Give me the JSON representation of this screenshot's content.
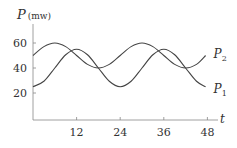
{
  "chart_data": {
    "type": "line",
    "title": "",
    "ylabel_var": "P",
    "ylabel_unit": "(mw)",
    "xlabel": "t",
    "x_ticks": [
      12,
      24,
      36,
      48
    ],
    "y_ticks": [
      20,
      40,
      60
    ],
    "xlim": [
      0,
      48
    ],
    "ylim": [
      0,
      75
    ],
    "grid": false,
    "legend_position": "inline-right",
    "x": [
      0,
      3,
      6,
      9,
      12,
      15,
      18,
      21,
      24,
      27,
      30,
      33,
      36,
      39,
      42,
      45,
      48
    ],
    "series": [
      {
        "name": "P1",
        "label_main": "P",
        "label_sub": "1",
        "formula": "40 - 15*cos(2*pi*t/24)",
        "values": [
          25,
          29.4,
          40,
          50.6,
          55,
          50.6,
          40,
          29.4,
          25,
          29.4,
          40,
          50.6,
          55,
          50.6,
          40,
          29.4,
          25
        ]
      },
      {
        "name": "P2",
        "label_main": "P",
        "label_sub": "2",
        "formula": "50 + 10*sin(2*pi*t/24)",
        "values": [
          50,
          57.1,
          60,
          57.1,
          50,
          42.9,
          40,
          42.9,
          50,
          57.1,
          60,
          57.1,
          50,
          42.9,
          40,
          42.9,
          50
        ]
      }
    ]
  },
  "colors": {
    "line": "#444444",
    "axis": "#777777",
    "text": "#333333"
  }
}
